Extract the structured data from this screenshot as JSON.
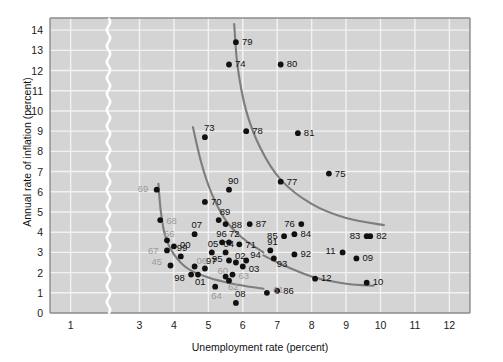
{
  "chart_data": {
    "type": "scatter",
    "title": "",
    "xlabel": "Unemployment rate (percent)",
    "ylabel": "Annual rate of inflation (percent)",
    "xlim": [
      0.4,
      12.6
    ],
    "ylim": [
      0,
      14.6
    ],
    "xticks": [
      1,
      3,
      4,
      5,
      6,
      7,
      8,
      9,
      10,
      11,
      12
    ],
    "yticks": [
      0,
      1,
      2,
      3,
      4,
      5,
      6,
      7,
      8,
      9,
      10,
      11,
      12,
      13,
      14
    ],
    "axis_break_x": 2.1,
    "grid": true,
    "legend": "none",
    "plot_bg": "#d4d4d4",
    "grid_color": "#f2f2f2",
    "point_color": "#111111",
    "curve_color": "#7d7d7d",
    "label_color_dark": "#111111",
    "label_color_gray": "#9a9a9a",
    "points": [
      {
        "label": "45",
        "x": 3.9,
        "y": 2.35,
        "tone": "gray",
        "lx": -19,
        "ly": -4
      },
      {
        "label": "61",
        "x": 6.7,
        "y": 1.0,
        "tone": "gray",
        "lx": 6,
        "ly": -3
      },
      {
        "label": "62",
        "x": 5.6,
        "y": 1.6,
        "tone": "gray",
        "lx": -1,
        "ly": 6
      },
      {
        "label": "63",
        "x": 5.7,
        "y": 1.9,
        "tone": "gray",
        "lx": 6,
        "ly": 1
      },
      {
        "label": "64",
        "x": 5.2,
        "y": 1.3,
        "tone": "gray",
        "lx": -4,
        "ly": 9
      },
      {
        "label": "66",
        "x": 3.8,
        "y": 3.6,
        "tone": "gray",
        "lx": -3,
        "ly": -6
      },
      {
        "label": "67",
        "x": 3.8,
        "y": 3.1,
        "tone": "gray",
        "lx": -19,
        "ly": 1
      },
      {
        "label": "68",
        "x": 3.6,
        "y": 4.6,
        "tone": "gray",
        "lx": 6,
        "ly": 1
      },
      {
        "label": "69",
        "x": 3.5,
        "y": 6.1,
        "tone": "gray",
        "lx": -19,
        "ly": -1
      },
      {
        "label": "60",
        "x": 5.5,
        "y": 1.8,
        "tone": "gray",
        "lx": -8,
        "ly": -6
      },
      {
        "label": "06",
        "x": 4.6,
        "y": 2.3,
        "tone": "gray",
        "lx": 2,
        "ly": -6
      },
      {
        "label": "70",
        "x": 4.9,
        "y": 5.5,
        "tone": "dark",
        "lx": 6,
        "ly": 0
      },
      {
        "label": "71",
        "x": 5.9,
        "y": 3.4,
        "tone": "dark",
        "lx": 6,
        "ly": 1
      },
      {
        "label": "72",
        "x": 5.6,
        "y": 3.5,
        "tone": "dark",
        "lx": 0,
        "ly": -8
      },
      {
        "label": "73",
        "x": 4.9,
        "y": 8.7,
        "tone": "dark",
        "lx": -1,
        "ly": -9
      },
      {
        "label": "74",
        "x": 5.6,
        "y": 12.3,
        "tone": "dark",
        "lx": 6,
        "ly": 0
      },
      {
        "label": "75",
        "x": 8.5,
        "y": 6.9,
        "tone": "dark",
        "lx": 6,
        "ly": 0
      },
      {
        "label": "76",
        "x": 7.7,
        "y": 4.4,
        "tone": "dark",
        "lx": -17,
        "ly": 0
      },
      {
        "label": "77",
        "x": 7.1,
        "y": 6.5,
        "tone": "dark",
        "lx": 6,
        "ly": 0
      },
      {
        "label": "78",
        "x": 6.1,
        "y": 9.0,
        "tone": "dark",
        "lx": 6,
        "ly": 0
      },
      {
        "label": "79",
        "x": 5.8,
        "y": 13.4,
        "tone": "dark",
        "lx": 6,
        "ly": 0
      },
      {
        "label": "80",
        "x": 7.1,
        "y": 12.3,
        "tone": "dark",
        "lx": 6,
        "ly": 0
      },
      {
        "label": "81",
        "x": 7.6,
        "y": 8.9,
        "tone": "dark",
        "lx": 6,
        "ly": 0
      },
      {
        "label": "82",
        "x": 9.7,
        "y": 3.8,
        "tone": "dark",
        "lx": 6,
        "ly": 0
      },
      {
        "label": "83",
        "x": 9.6,
        "y": 3.8,
        "tone": "dark",
        "lx": -17,
        "ly": 0
      },
      {
        "label": "84",
        "x": 7.5,
        "y": 3.9,
        "tone": "dark",
        "lx": 6,
        "ly": 0
      },
      {
        "label": "85",
        "x": 7.2,
        "y": 3.8,
        "tone": "dark",
        "lx": -17,
        "ly": 0
      },
      {
        "label": "86",
        "x": 7.0,
        "y": 1.1,
        "tone": "dark",
        "lx": 6,
        "ly": 0
      },
      {
        "label": "87",
        "x": 6.2,
        "y": 4.4,
        "tone": "dark",
        "lx": 6,
        "ly": 0
      },
      {
        "label": "88",
        "x": 5.5,
        "y": 4.4,
        "tone": "dark",
        "lx": 6,
        "ly": 1
      },
      {
        "label": "89",
        "x": 5.3,
        "y": 4.6,
        "tone": "dark",
        "lx": 1,
        "ly": -8
      },
      {
        "label": "90",
        "x": 5.6,
        "y": 6.1,
        "tone": "dark",
        "lx": -1,
        "ly": -9
      },
      {
        "label": "91",
        "x": 6.8,
        "y": 3.1,
        "tone": "dark",
        "lx": -3,
        "ly": -8
      },
      {
        "label": "92",
        "x": 7.5,
        "y": 2.9,
        "tone": "dark",
        "lx": 6,
        "ly": 0
      },
      {
        "label": "93",
        "x": 6.9,
        "y": 2.7,
        "tone": "dark",
        "lx": 3,
        "ly": 6
      },
      {
        "label": "94",
        "x": 6.1,
        "y": 2.6,
        "tone": "dark",
        "lx": 4,
        "ly": -5
      },
      {
        "label": "95",
        "x": 5.6,
        "y": 2.6,
        "tone": "dark",
        "lx": -17,
        "ly": -1
      },
      {
        "label": "96",
        "x": 5.4,
        "y": 3.5,
        "tone": "dark",
        "lx": -6,
        "ly": -8
      },
      {
        "label": "97",
        "x": 4.9,
        "y": 2.2,
        "tone": "dark",
        "lx": 1,
        "ly": -8
      },
      {
        "label": "98",
        "x": 4.5,
        "y": 1.9,
        "tone": "dark",
        "lx": -17,
        "ly": 3
      },
      {
        "label": "99",
        "x": 4.2,
        "y": 2.8,
        "tone": "dark",
        "lx": -4,
        "ly": -8
      },
      {
        "label": "00",
        "x": 4.0,
        "y": 3.3,
        "tone": "dark",
        "lx": 6,
        "ly": -1
      },
      {
        "label": "01",
        "x": 4.7,
        "y": 1.9,
        "tone": "dark",
        "lx": -3,
        "ly": 7
      },
      {
        "label": "02",
        "x": 5.8,
        "y": 2.5,
        "tone": "dark",
        "lx": -1,
        "ly": -6
      },
      {
        "label": "03",
        "x": 6.0,
        "y": 2.3,
        "tone": "dark",
        "lx": 6,
        "ly": 2
      },
      {
        "label": "04",
        "x": 5.5,
        "y": 3.0,
        "tone": "dark",
        "lx": -2,
        "ly": -8
      },
      {
        "label": "05",
        "x": 5.1,
        "y": 3.0,
        "tone": "dark",
        "lx": -4,
        "ly": -8
      },
      {
        "label": "07",
        "x": 4.6,
        "y": 3.9,
        "tone": "dark",
        "lx": -3,
        "ly": -9
      },
      {
        "label": "08",
        "x": 5.8,
        "y": 0.5,
        "tone": "dark",
        "lx": -1,
        "ly": -9
      },
      {
        "label": "09",
        "x": 9.3,
        "y": 2.7,
        "tone": "dark",
        "lx": 6,
        "ly": 0
      },
      {
        "label": "10",
        "x": 9.6,
        "y": 1.5,
        "tone": "dark",
        "lx": 6,
        "ly": -1
      },
      {
        "label": "11",
        "x": 8.9,
        "y": 3.0,
        "tone": "dark",
        "lx": -17,
        "ly": -1
      },
      {
        "label": "12",
        "x": 8.1,
        "y": 1.7,
        "tone": "dark",
        "lx": 6,
        "ly": -1
      }
    ],
    "curves": [
      {
        "name": "curve-1960s",
        "points": [
          [
            3.55,
            6.4
          ],
          [
            3.62,
            5.0
          ],
          [
            3.75,
            3.8
          ],
          [
            4.0,
            2.9
          ],
          [
            4.4,
            2.2
          ],
          [
            5.0,
            1.75
          ],
          [
            5.7,
            1.45
          ],
          [
            6.6,
            1.2
          ]
        ]
      },
      {
        "name": "curve-1970s",
        "points": [
          [
            4.55,
            9.2
          ],
          [
            4.8,
            7.4
          ],
          [
            5.1,
            5.9
          ],
          [
            5.5,
            4.6
          ],
          [
            6.0,
            3.7
          ],
          [
            6.6,
            3.0
          ]
        ]
      },
      {
        "name": "curve-1980s",
        "points": [
          [
            5.75,
            14.3
          ],
          [
            5.85,
            12.2
          ],
          [
            6.1,
            10.0
          ],
          [
            6.5,
            8.2
          ],
          [
            7.1,
            6.6
          ],
          [
            8.0,
            5.4
          ],
          [
            9.0,
            4.7
          ],
          [
            10.1,
            4.35
          ]
        ]
      },
      {
        "name": "curve-2000s",
        "points": [
          [
            6.6,
            2.85
          ],
          [
            7.2,
            2.35
          ],
          [
            8.1,
            1.75
          ],
          [
            9.0,
            1.45
          ],
          [
            9.8,
            1.35
          ]
        ]
      }
    ]
  }
}
